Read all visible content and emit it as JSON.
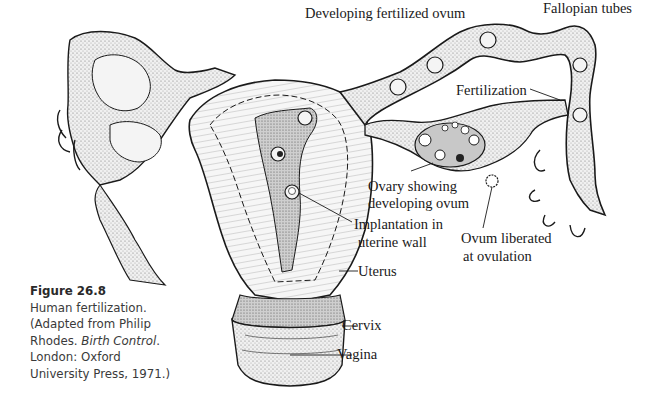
{
  "figure": {
    "number_label": "Figure 26.8",
    "caption_line1": "Human fertilization.",
    "caption_line2": "(Adapted from Philip",
    "caption_line3_prefix": "Rhodes. ",
    "caption_line3_italic": "Birth Control",
    "caption_line3_suffix": ".",
    "caption_line4": "London: Oxford",
    "caption_line5": "University Press, 1971.)"
  },
  "labels": {
    "developing_ovum": "Developing fertilized ovum",
    "fallopian": "Fallopian  tubes",
    "fertilization": "Fertilization",
    "ovary_1": "Ovary showing",
    "ovary_2": "developing ovum",
    "implant_1": "Implantation in",
    "implant_2": "uterine wall",
    "ovum_lib_1": "Ovum liberated",
    "ovum_lib_2": "at ovulation",
    "uterus": "Uterus",
    "cervix": "Cervix",
    "vagina": "Vagina"
  },
  "colors": {
    "ink": "#1a1a1a",
    "tissue_fill": "#e4e4e4",
    "cavity_fill": "#bdbdbd",
    "light_fill": "#f2f2f2"
  }
}
